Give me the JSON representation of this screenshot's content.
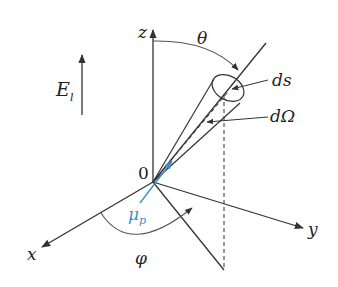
{
  "figure": {
    "type": "3D spherical coordinate diagram",
    "colors": {
      "line": "#333333",
      "accent": "#3b8fd0",
      "background": "#ffffff"
    },
    "labels": {
      "field": {
        "symbol": "E",
        "subscript": "l"
      },
      "z_axis": "z",
      "x_axis": "x",
      "y_axis": "y",
      "origin": "0",
      "polar_angle": "θ",
      "azimuth_angle": "φ",
      "surface_element": "ds",
      "solid_angle": "dΩ",
      "dipole": {
        "symbol": "μ",
        "subscript": "p"
      }
    }
  }
}
